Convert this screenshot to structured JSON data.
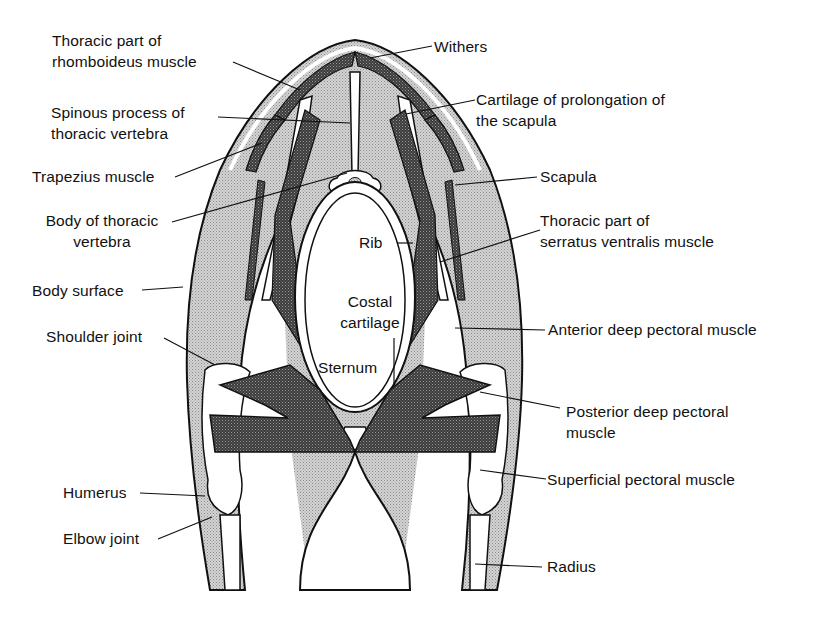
{
  "diagram": {
    "colors": {
      "ink": "#111111",
      "light_fill": "#c8c8c8",
      "dark_fill": "#4a4a4a",
      "background": "#ffffff"
    },
    "labels": {
      "withers": "Withers",
      "rhomboideus_1": "Thoracic part of",
      "rhomboideus_2": "rhomboideus muscle",
      "spinous_1": "Spinous process of",
      "spinous_2": "thoracic vertebra",
      "cartilage_scapula_1": "Cartilage of prolongation of",
      "cartilage_scapula_2": "the scapula",
      "trapezius": "Trapezius muscle",
      "scapula": "Scapula",
      "body_vertebra_1": "Body of thoracic",
      "body_vertebra_2": "vertebra",
      "serratus_1": "Thoracic part of",
      "serratus_2": "serratus ventralis muscle",
      "rib": "Rib",
      "body_surface": "Body surface",
      "costal_1": "Costal",
      "costal_2": "cartilage",
      "shoulder_joint": "Shoulder joint",
      "anterior_deep_pectoral": "Anterior deep pectoral muscle",
      "sternum": "Sternum",
      "posterior_deep_pectoral_1": "Posterior deep pectoral",
      "posterior_deep_pectoral_2": "muscle",
      "humerus": "Humerus",
      "superficial_pectoral": "Superficial pectoral muscle",
      "elbow_joint": "Elbow joint",
      "radius": "Radius"
    }
  }
}
